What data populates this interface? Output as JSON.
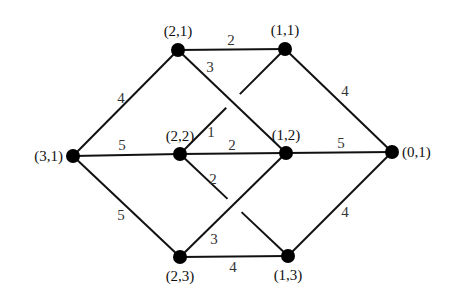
{
  "diagram": {
    "type": "weighted-graph",
    "nodes": [
      {
        "id": "n31",
        "label": "(3,1)"
      },
      {
        "id": "n21",
        "label": "(2,1)"
      },
      {
        "id": "n22",
        "label": "(2,2)"
      },
      {
        "id": "n23",
        "label": "(2,3)"
      },
      {
        "id": "n11",
        "label": "(1,1)"
      },
      {
        "id": "n12",
        "label": "(1,2)"
      },
      {
        "id": "n13",
        "label": "(1,3)"
      },
      {
        "id": "n01",
        "label": "(0,1)"
      }
    ],
    "edges": [
      {
        "from": "n31",
        "to": "n21",
        "weight": "4"
      },
      {
        "from": "n31",
        "to": "n22",
        "weight": "5"
      },
      {
        "from": "n31",
        "to": "n23",
        "weight": "5"
      },
      {
        "from": "n21",
        "to": "n11",
        "weight": "2"
      },
      {
        "from": "n21",
        "to": "n12",
        "weight": "3"
      },
      {
        "from": "n22",
        "to": "n11",
        "weight": "1",
        "crosses_under": true
      },
      {
        "from": "n22",
        "to": "n12",
        "weight": "2"
      },
      {
        "from": "n22",
        "to": "n13",
        "weight": "2",
        "crosses_under": true
      },
      {
        "from": "n23",
        "to": "n12",
        "weight": "3"
      },
      {
        "from": "n23",
        "to": "n13",
        "weight": "4"
      },
      {
        "from": "n11",
        "to": "n01",
        "weight": "4"
      },
      {
        "from": "n12",
        "to": "n01",
        "weight": "5"
      },
      {
        "from": "n13",
        "to": "n01",
        "weight": "4"
      }
    ]
  }
}
